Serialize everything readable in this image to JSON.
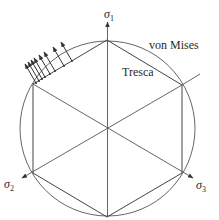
{
  "diagram": {
    "type": "yield-surface-pi-plane",
    "labels": {
      "axis1": "σ",
      "axis1_sub": "1",
      "axis2": "σ",
      "axis2_sub": "2",
      "axis3": "σ",
      "axis3_sub": "3",
      "von_mises": "von Mises",
      "tresca": "Tresca"
    },
    "geometry": {
      "center": [
        107.5,
        128.5
      ],
      "circle_radius": 87.5,
      "hexagon_vertices": [
        [
          107,
          40
        ],
        [
          182,
          85
        ],
        [
          182,
          173
        ],
        [
          107,
          217
        ],
        [
          33,
          173
        ],
        [
          33,
          84
        ]
      ]
    },
    "normal_arrows_count": 8,
    "colors": {
      "line": "#555555",
      "text": "#2a2a2a",
      "background": "#ffffff"
    }
  }
}
